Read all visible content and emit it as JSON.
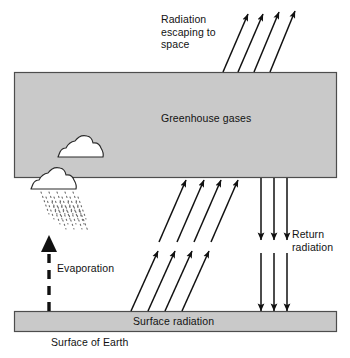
{
  "diagram": {
    "colors": {
      "box_fill": "#c9c9c9",
      "box_stroke": "#4d4d4d",
      "arrow": "#111111",
      "text": "#121212",
      "background": "#ffffff",
      "cloud_fill": "#ffffff",
      "cloud_stroke": "#2b2b2b",
      "rain": "#6b6b6b"
    },
    "labels": {
      "radiation_escaping": "Radiation\nescaping to\nspace",
      "greenhouse_gases": "Greenhouse gases",
      "return_radiation": "Return\nradiation",
      "evaporation": "Evaporation",
      "surface_radiation": "Surface radiation",
      "surface_of_earth": "Surface of Earth"
    },
    "elements": {
      "greenhouse_box": {
        "x": 14,
        "y": 72,
        "width": 323,
        "height": 106
      },
      "surface_bar": {
        "x": 14,
        "y": 311,
        "width": 323,
        "height": 21
      },
      "clouds": [
        {
          "name": "upper-cloud",
          "x": 57,
          "y": 143
        },
        {
          "name": "rain-cloud",
          "x": 30,
          "y": 175
        }
      ],
      "arrow_groups": [
        {
          "name": "escaping-radiation-arrows",
          "count": 4,
          "direction": "up-right"
        },
        {
          "name": "upward-radiation-arrows-upper",
          "count": 4,
          "direction": "up-right"
        },
        {
          "name": "upward-radiation-arrows-lower",
          "count": 4,
          "direction": "up-right"
        },
        {
          "name": "return-radiation-arrows",
          "count": 3,
          "direction": "down"
        },
        {
          "name": "evaporation-arrow",
          "count": 1,
          "direction": "up",
          "style": "dashed"
        }
      ],
      "rain_streaks": {
        "count": 18,
        "style": "dotted-diagonal"
      }
    }
  }
}
